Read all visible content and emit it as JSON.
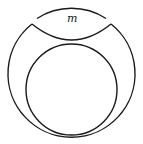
{
  "diagram": {
    "type": "geometric-figure",
    "colors": {
      "stroke": "#1a1a1a",
      "background": "#ffffff"
    },
    "outer_circle": {
      "cx": 71.5,
      "cy": 72,
      "r": 63.5
    },
    "inner_circle": {
      "cx": 71.5,
      "cy": 89.5,
      "r": 45.5
    },
    "cap": {
      "label": "m",
      "left_cusp": [
        32,
        24
      ],
      "right_cusp": [
        111,
        24
      ],
      "top_arc_start": [
        37,
        19
      ],
      "top_arc_end": [
        107,
        19
      ],
      "lower_arc_lowest_y": 40
    }
  }
}
